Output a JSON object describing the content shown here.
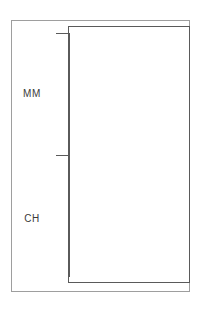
{
  "figure": {
    "background_color": "#ffffff",
    "outer_frame_color": "#9e9e9e",
    "plot_frame_color": "#5a5a5a",
    "bar_fill_color": "#bcbcbc",
    "bar_edge_color": "#5a5a5a"
  },
  "axis": {
    "tick_labels": [
      "MM",
      "CH"
    ]
  },
  "chart_data": {
    "type": "bar",
    "orientation": "horizontal",
    "title": "",
    "subtitle": "",
    "xlabel": "",
    "ylabel": "",
    "categories": [
      "MM",
      "CH"
    ],
    "values": [
      62,
      96
    ],
    "xlim": [
      0,
      100
    ],
    "grid": false,
    "legend": null,
    "legend_position": "none",
    "series": [
      {
        "name": "",
        "values": [
          62,
          96
        ],
        "fill": "#bcbcbc",
        "edge": "#5a5a5a"
      }
    ],
    "annotations": []
  }
}
